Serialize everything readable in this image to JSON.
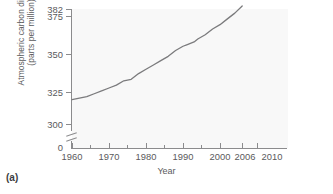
{
  "figure": {
    "panel_label": "(a)",
    "background_color": "#ffffff",
    "plot_background_color": "#f8f8f8",
    "line_color": "#7b7b7d",
    "axis_color": "#8b8b8d"
  },
  "chart_data": {
    "type": "line",
    "title": "",
    "xlabel": "Year",
    "ylabel": "Atmospheric carbon dioxide (parts per million)",
    "ylabel_line1": "Atmospheric carbon dioxide",
    "ylabel_line2": "(parts per million)",
    "xlim": [
      1960,
      2010
    ],
    "ylim": [
      300,
      382
    ],
    "y_axis_break": true,
    "y_axis_break_from": 0,
    "y_axis_break_to": 300,
    "grid": false,
    "legend": null,
    "xticks": [
      1960,
      1970,
      1980,
      1990,
      2000,
      2006,
      2010
    ],
    "xtick_labels": [
      "1960",
      "1970",
      "1980",
      "1990",
      "2000",
      "2006",
      "2010"
    ],
    "x_minor_ticks": [
      1965,
      1975,
      1985,
      1995,
      2005
    ],
    "yticks": [
      0,
      300,
      325,
      350,
      375,
      382
    ],
    "ytick_labels": [
      "0",
      "300",
      "325",
      "350",
      "375",
      "382"
    ],
    "series_name": "Atmospheric CO2",
    "x": [
      1960,
      1962,
      1964,
      1966,
      1968,
      1970,
      1972,
      1974,
      1976,
      1978,
      1980,
      1982,
      1984,
      1986,
      1988,
      1990,
      1991,
      1992,
      1993,
      1994,
      1996,
      1998,
      2000,
      2002,
      2004,
      2006
    ],
    "values": [
      317,
      318,
      319,
      321,
      323,
      325,
      327,
      330,
      331,
      335,
      338,
      341,
      344,
      347,
      351,
      354,
      355,
      356,
      357,
      359,
      362,
      366,
      369,
      373,
      377,
      382
    ],
    "units": "ppm"
  }
}
